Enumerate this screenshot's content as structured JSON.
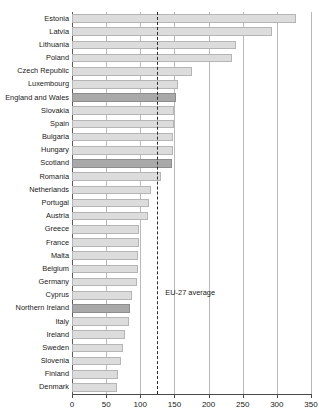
{
  "chart_data": {
    "type": "bar",
    "orientation": "horizontal",
    "title": "",
    "xlabel": "",
    "ylabel": "",
    "xlim": [
      0,
      350
    ],
    "xticks": [
      0,
      50,
      100,
      150,
      200,
      250,
      300,
      350
    ],
    "xtick_labels": [
      "0",
      "50",
      "100",
      "150",
      "200",
      "250",
      "300",
      "350"
    ],
    "grid": true,
    "legend": "none",
    "categories": [
      "Estonia",
      "Latvia",
      "Lithuania",
      "Poland",
      "Czech Republic",
      "Luxembourg",
      "England and Wales",
      "Slovakia",
      "Spain",
      "Bulgaria",
      "Hungary",
      "Scotland",
      "Romania",
      "Netherlands",
      "Portugal",
      "Austria",
      "Greece",
      "France",
      "Malta",
      "Belgium",
      "Germany",
      "Cyprus",
      "Northern Ireland",
      "Italy",
      "Ireland",
      "Sweden",
      "Slovenia",
      "Finland",
      "Denmark"
    ],
    "values": [
      328,
      293,
      240,
      235,
      175,
      155,
      152,
      150,
      150,
      148,
      148,
      146,
      130,
      115,
      113,
      112,
      98,
      98,
      97,
      97,
      95,
      88,
      85,
      83,
      78,
      75,
      72,
      68,
      66
    ],
    "highlighted": [
      "England and Wales",
      "Scotland",
      "Northern Ireland"
    ],
    "annotations": [
      {
        "name": "eu-27-average",
        "label": "EU-27 average",
        "value": 125,
        "style": "dashed-vertical-line"
      }
    ],
    "colors": {
      "bar": "#dcdcdc",
      "bar_highlight": "#a9a9a9",
      "bar_border": "#b5b5b5",
      "gridline": "#b9b9b9",
      "axis": "#4a4a4a",
      "annotation_line": "#2b2b2b",
      "text": "#1a1a1a",
      "background": "#ffffff"
    }
  }
}
